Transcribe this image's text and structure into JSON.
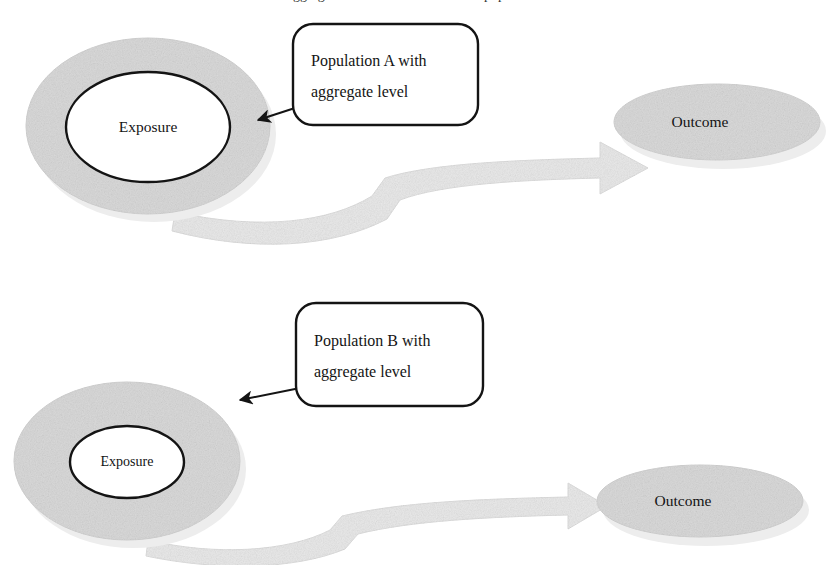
{
  "figure": {
    "title_clipped": "aggregate level is the same in both populations",
    "background_color": "#ffffff",
    "width": 836,
    "height": 565
  },
  "palette": {
    "population_fill": "#d9d9d9",
    "population_shadow": "#ececec",
    "population_stroke": "#cfcfcf",
    "exposure_fill": "#ffffff",
    "exposure_stroke": "#141414",
    "outcome_fill": "#d9d9d9",
    "outcome_shadow": "#ececec",
    "arrow_fill": "#e8e8e8",
    "arrow_stroke": "#dcdcdc",
    "callout_stroke": "#141414",
    "callout_fill": "#ffffff",
    "pointer_stroke": "#141414",
    "text_color": "#141414"
  },
  "rows": [
    {
      "id": "row-a",
      "population": {
        "label": "Population A",
        "ellipse": {
          "cx": 148,
          "cy": 126,
          "rx": 122,
          "ry": 88
        }
      },
      "exposure": {
        "label": "Exposure",
        "ellipse": {
          "cx": 148,
          "cy": 127,
          "rx": 82,
          "ry": 55
        }
      },
      "outcome": {
        "label": "Outcome",
        "ellipse": {
          "cx": 717,
          "cy": 122,
          "rx": 103,
          "ry": 38
        }
      },
      "callout": {
        "line1": "Population A with",
        "line2": "aggregate level",
        "box": {
          "x": 293,
          "y": 24,
          "width": 185,
          "height": 101,
          "radius": 20
        },
        "pointer_from": {
          "x": 298,
          "y": 107
        },
        "pointer_to": {
          "x": 256,
          "y": 120
        }
      },
      "arrow": {
        "name": "effect-arrow-a",
        "thickness": "thick"
      }
    },
    {
      "id": "row-b",
      "population": {
        "label": "Population B",
        "ellipse": {
          "cx": 127,
          "cy": 461,
          "rx": 113,
          "ry": 79
        }
      },
      "exposure": {
        "label": "Exposure",
        "ellipse": {
          "cx": 127,
          "cy": 462,
          "rx": 57,
          "ry": 36
        }
      },
      "outcome": {
        "label": "Outcome",
        "ellipse": {
          "cx": 700,
          "cy": 501,
          "rx": 103,
          "ry": 36
        }
      },
      "callout": {
        "line1": "Population B with",
        "line2": "aggregate level",
        "box": {
          "x": 296,
          "y": 303,
          "width": 187,
          "height": 103,
          "radius": 20
        },
        "pointer_from": {
          "x": 300,
          "y": 388
        },
        "pointer_to": {
          "x": 238,
          "y": 400
        }
      },
      "arrow": {
        "name": "effect-arrow-b",
        "thickness": "thin"
      }
    }
  ]
}
